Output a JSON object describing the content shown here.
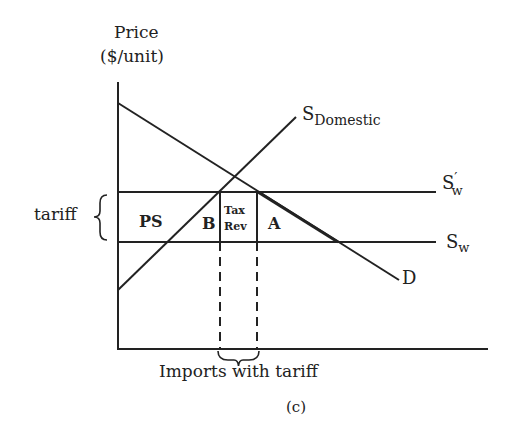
{
  "figure": {
    "caption": "(c)",
    "axis": {
      "y_label_line1": "Price",
      "y_label_line2": "($/unit)",
      "x_label": "Imports with tariff"
    },
    "curves": {
      "demand": {
        "label": "D"
      },
      "domestic_supply": {
        "label_main": "S",
        "label_sub": "Domestic"
      },
      "world_supply_with_tariff": {
        "label_main": "S",
        "label_prime": "′",
        "label_sub": "w"
      },
      "world_supply": {
        "label_main": "S",
        "label_sub": "w"
      }
    },
    "brace_label": "tariff",
    "regions": {
      "producer_surplus": "PS",
      "deadweight_b": "B",
      "tax_revenue_line1": "Tax",
      "tax_revenue_line2": "Rev",
      "deadweight_a": "A"
    },
    "colors": {
      "ink": "#222222",
      "background": "#ffffff"
    }
  }
}
